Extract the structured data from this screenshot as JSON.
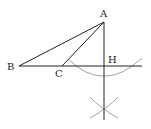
{
  "diagram": {
    "points": [
      {
        "id": "A",
        "label": "A",
        "x": 104,
        "y": 22,
        "lx": 100,
        "ly": 17
      },
      {
        "id": "B",
        "label": "B",
        "x": 19,
        "y": 66,
        "lx": 7,
        "ly": 70
      },
      {
        "id": "C",
        "label": "C",
        "x": 62,
        "y": 66,
        "lx": 55,
        "ly": 77
      },
      {
        "id": "H",
        "label": "H",
        "x": 104,
        "y": 66,
        "lx": 108,
        "ly": 63
      }
    ],
    "segments": [
      {
        "name": "segment-AB",
        "from": "A",
        "to": "B"
      },
      {
        "name": "segment-AC",
        "from": "A",
        "to": "C"
      },
      {
        "name": "line-BC-extended",
        "x1": 19,
        "y1": 66,
        "x2": 142,
        "y2": 66
      },
      {
        "name": "perpendicular-AH",
        "x1": 104,
        "y1": 22,
        "x2": 104,
        "y2": 120
      }
    ],
    "arcs": [
      {
        "name": "arc-centered-A",
        "d": "M 68 59 Q 104 94 142 58"
      },
      {
        "name": "arc-lower-left",
        "d": "M 90 97 Q 100 108 118 118"
      },
      {
        "name": "arc-lower-right",
        "d": "M 118 97 Q 108 108 90 118"
      }
    ]
  }
}
